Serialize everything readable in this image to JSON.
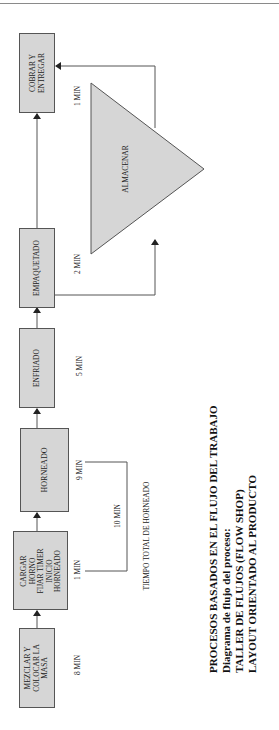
{
  "diagram": {
    "type": "process_flow",
    "steps": [
      {
        "id": "mezclar",
        "label": "MEZCLAR Y\nCOLOCAR LA\nMASA",
        "time": "8 MIN"
      },
      {
        "id": "cargar",
        "label": "CARGAR\nHORNO\nFIJAR TIMER\nINICIO\nHORNEADO",
        "time": "1 MIN"
      },
      {
        "id": "horneado",
        "label": "HORNEADO",
        "time": "9 MIN"
      },
      {
        "id": "enfriado",
        "label": "ENFRIADO",
        "time": "5 MIN"
      },
      {
        "id": "empaquetado",
        "label": "EMPAQUETADO",
        "time": "2 MIN"
      },
      {
        "id": "cobrar",
        "label": "COBRAR Y\nENTREGAR",
        "time": "1 MIN"
      }
    ],
    "storage": {
      "label": "ALMACENAR"
    },
    "bracket": {
      "value": "10 MIN",
      "caption": "TIEMPO TOTAL DE HORNEADO"
    },
    "title_block": [
      "PROCESOS BASADOS EN EL FLUJO DEL TRABAJO",
      "Diagrama de flujo del proceso:",
      "TALLER DE FLUJOS (FLOW SHOP)",
      "LAYOUT ORIENTADO AL PRODUCTO"
    ],
    "colors": {
      "box_fill": "#d6d6d6",
      "border": "#555555",
      "line": "#555555"
    }
  }
}
